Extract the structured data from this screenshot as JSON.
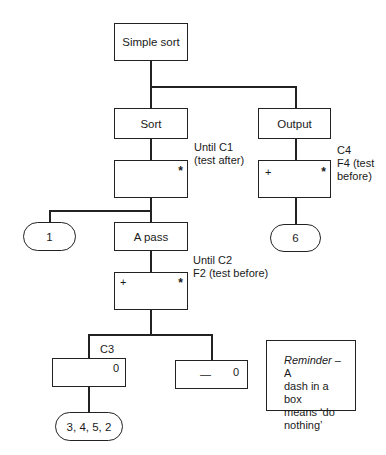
{
  "diagram": {
    "type": "Jackson structure diagram",
    "root": {
      "label": "Simple sort"
    },
    "sort": {
      "label": "Sort",
      "condition": "Until C1\n(test after)",
      "iter_symbol": "*"
    },
    "output": {
      "label": "Output",
      "condition": "C4\nF4 (test\nbefore)",
      "iter_symbol": "*",
      "plus_symbol": "+"
    },
    "node_1": {
      "label": "1"
    },
    "node_6": {
      "label": "6"
    },
    "a_pass": {
      "label": "A pass",
      "condition": "Until C2\nF2 (test before)",
      "iter_symbol": "*",
      "plus_symbol": "+"
    },
    "selection_c3": {
      "condition": "C3",
      "select_symbol": "0"
    },
    "selection_else": {
      "body": "—",
      "select_symbol": "0"
    },
    "node_3452": {
      "label": "3, 4, 5, 2"
    },
    "reminder": {
      "italic": "Reminder",
      "text": " – A\ndash in a box\nmeans ‘do\nnothing’"
    }
  }
}
